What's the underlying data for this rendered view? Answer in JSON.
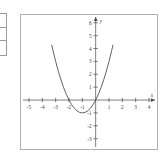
{
  "left_fragment": {
    "name": "cut-off-table-fragment",
    "row_count": 3,
    "border_color": "#9a9a9a"
  },
  "figure": {
    "frame_color": "#b0b0b0",
    "background": "#ffffff"
  },
  "chart_data": {
    "type": "line",
    "title": "",
    "subtitle": "",
    "xlabel": "x",
    "ylabel": "y",
    "xlim": [
      -5.6,
      4.6
    ],
    "ylim": [
      -3.8,
      6.6
    ],
    "grid": false,
    "legend": null,
    "axis_arrows": true,
    "xticks": [
      -5,
      -4,
      -3,
      -2,
      -1,
      1,
      2,
      3,
      4
    ],
    "xticklabels": [
      "-5",
      "-4",
      "-3",
      "-2",
      "-1",
      "1",
      "2",
      "3",
      "4"
    ],
    "yticks": [
      -3,
      -2,
      -1,
      1,
      2,
      3,
      4,
      5,
      6
    ],
    "yticklabels": [
      "-3",
      "-2",
      "-1",
      "1",
      "2",
      "3",
      "4",
      "5",
      "6"
    ],
    "series": [
      {
        "name": "parabola",
        "equation": "y = x^2 + 2x",
        "color": "#3a3a3a",
        "vertex": [
          -1,
          -1
        ],
        "roots": [
          -2,
          0
        ],
        "x": [
          -3.3,
          -3.2,
          -3.1,
          -3.0,
          -2.8,
          -2.6,
          -2.4,
          -2.2,
          -2.0,
          -1.8,
          -1.6,
          -1.4,
          -1.2,
          -1.0,
          -0.8,
          -0.6,
          -0.4,
          -0.2,
          0.0,
          0.2,
          0.4,
          0.6,
          0.8,
          1.0,
          1.2,
          1.3
        ],
        "values": [
          4.29,
          3.84,
          3.41,
          3.0,
          2.24,
          1.56,
          0.96,
          0.44,
          0.0,
          -0.36,
          -0.64,
          -0.84,
          -0.96,
          -1.0,
          -0.96,
          -0.84,
          -0.64,
          -0.36,
          0.0,
          0.44,
          0.96,
          1.56,
          2.24,
          3.0,
          3.84,
          4.29
        ]
      }
    ]
  }
}
